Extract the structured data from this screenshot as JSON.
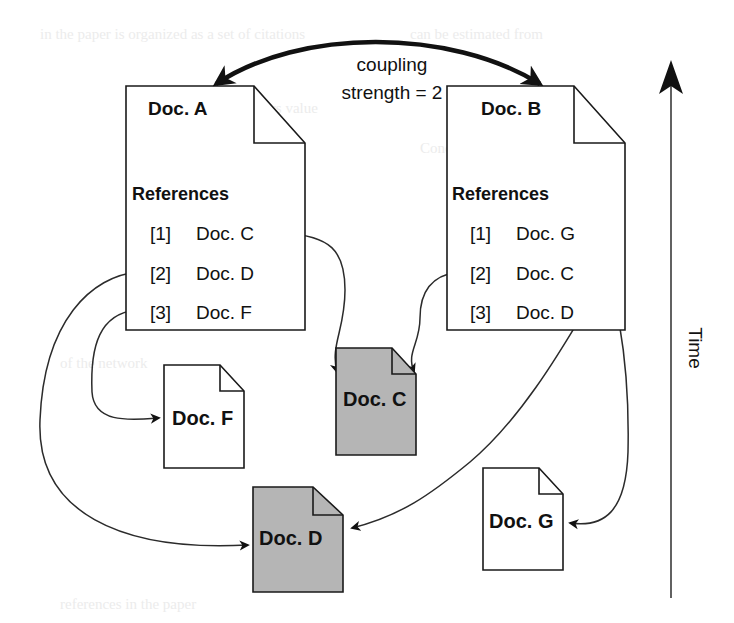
{
  "figure": {
    "background_color": "#ffffff",
    "line_color": "#1a1a1a",
    "shaded_fill": "#b5b5b5",
    "plain_fill": "#ffffff"
  },
  "coupling": {
    "line1": "coupling",
    "line2": "strength = 2"
  },
  "axis": {
    "label": "Time"
  },
  "documents": {
    "a": {
      "title": "Doc. A",
      "refs_heading": "References",
      "references": [
        {
          "num": "[1]",
          "target": "Doc. C"
        },
        {
          "num": "[2]",
          "target": "Doc. D"
        },
        {
          "num": "[3]",
          "target": "Doc. F"
        }
      ],
      "shaded": "no"
    },
    "b": {
      "title": "Doc. B",
      "refs_heading": "References",
      "references": [
        {
          "num": "[1]",
          "target": "Doc. G"
        },
        {
          "num": "[2]",
          "target": "Doc. C"
        },
        {
          "num": "[3]",
          "target": "Doc. D"
        }
      ],
      "shaded": "no"
    },
    "f": {
      "title": "Doc. F",
      "shaded": "no"
    },
    "c": {
      "title": "Doc. C",
      "shaded": "yes"
    },
    "d": {
      "title": "Doc. D",
      "shaded": "yes"
    },
    "g": {
      "title": "Doc. G",
      "shaded": "no"
    }
  },
  "bleed_text": [
    {
      "text": "the paper is organized",
      "x": 40,
      "y": 34
    },
    {
      "text": "can be estimated",
      "x": 300,
      "y": 34
    },
    {
      "text": "numbers value",
      "x": 250,
      "y": 108
    },
    {
      "text": "Conc",
      "x": 430,
      "y": 150
    },
    {
      "text": "1 2 3",
      "x": 120,
      "y": 200
    },
    {
      "text": "of the network",
      "x": 60,
      "y": 360
    },
    {
      "text": "couple",
      "x": 470,
      "y": 430
    },
    {
      "text": "references in the paper",
      "x": 60,
      "y": 600
    }
  ]
}
